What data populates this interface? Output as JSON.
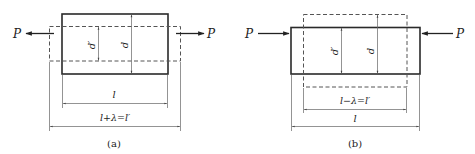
{
  "figure_a": {
    "caption": "(a)",
    "force_left": "P",
    "force_right": "P",
    "inner_dim": "d′",
    "outer_dim": "d",
    "length_original": "l",
    "length_deformed": "l+λ=l′",
    "loading": "tension"
  },
  "figure_b": {
    "caption": "(b)",
    "force_left": "P",
    "force_right": "P",
    "inner_dim": "d′",
    "outer_dim": "d",
    "length_deformed": "l−λ=l′",
    "length_original": "l",
    "loading": "compression"
  }
}
